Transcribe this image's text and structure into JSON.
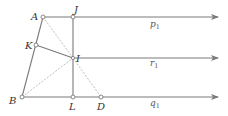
{
  "diagram": {
    "type": "geometry",
    "colors": {
      "line": "#7a7a7a",
      "dashed": "#b5b5b5",
      "point_fill": "#ffffff",
      "label": "#333333"
    },
    "points": {
      "A": {
        "label": "A",
        "x": 43,
        "y": 17
      },
      "J": {
        "label": "J",
        "x": 73,
        "y": 17
      },
      "K": {
        "label": "K",
        "x": 36,
        "y": 45
      },
      "I": {
        "label": "I",
        "x": 73,
        "y": 58
      },
      "B": {
        "label": "B",
        "x": 22,
        "y": 97
      },
      "L": {
        "label": "L",
        "x": 73,
        "y": 97
      },
      "D": {
        "label": "D",
        "x": 101,
        "y": 97
      }
    },
    "lines": {
      "p1": {
        "name": "p",
        "sub": "1",
        "y": 17
      },
      "r1": {
        "name": "r",
        "sub": "1",
        "y": 58
      },
      "q1": {
        "name": "q",
        "sub": "1",
        "y": 97
      }
    },
    "solid_segments": [
      "A-B",
      "J-L",
      "K-I"
    ],
    "dashed_segments": [
      "A-I",
      "I-D",
      "B-I"
    ]
  }
}
